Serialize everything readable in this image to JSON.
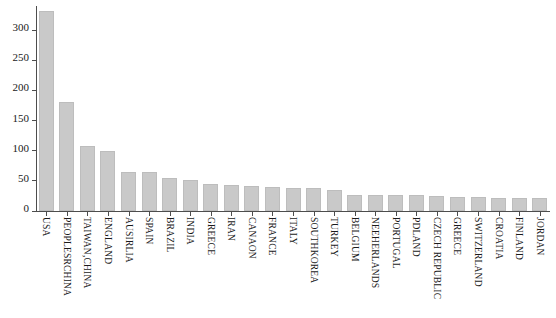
{
  "chart_data": {
    "type": "bar",
    "title": "",
    "subtitle": "",
    "xlabel": "",
    "ylabel": "",
    "ylim": [
      0,
      340
    ],
    "yticks": [
      0,
      50,
      100,
      150,
      200,
      250,
      300
    ],
    "ytick_labels": [
      "0",
      "50",
      "100",
      "150",
      "200",
      "250",
      "300"
    ],
    "grid": false,
    "legend": null,
    "bar_color": "#c9c9c9",
    "bar_edge_color": "#bdbdbd",
    "axis_color": "#4d4d4d",
    "categories": [
      "USA",
      "PEOPLESRCHINA",
      "TAIWAN,CHINA",
      "ENGLAND",
      "AUSIRLIA",
      "SPAIN",
      "BRAZIL",
      "INDIA",
      "GREECE",
      "IRAN",
      "CANAON",
      "FRANCE",
      "ITALY",
      "SOUTHKOREA",
      "TURKEY",
      "BELGIUM",
      "NEEHERLANDS",
      "PORTUGAL",
      "PDLAND",
      "CZECH REPUBLIC",
      "GREECE",
      "SWITZERLAND",
      "CROATIA",
      "FINLAND",
      "JORDAN"
    ],
    "values": [
      331,
      180,
      108,
      99,
      65,
      64,
      55,
      52,
      45,
      43,
      41,
      40,
      39,
      38,
      35,
      27,
      27,
      26,
      26,
      25,
      24,
      23,
      22,
      22,
      21
    ]
  }
}
